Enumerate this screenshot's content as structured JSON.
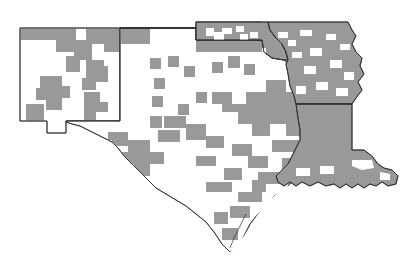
{
  "figure": {
    "name": "south-central-us-county-map",
    "type": "choropleth-county-map",
    "background_color": "#ffffff",
    "shaded_color": "#999999",
    "unshaded_color": "#ffffff",
    "border_color": "#2b2b2b",
    "width": 418,
    "height": 277
  },
  "legend": {
    "shaded_label": "",
    "unshaded_label": "",
    "visible": false
  },
  "states": [
    {
      "code": "NM",
      "name": "New Mexico",
      "shaded_share": "partial"
    },
    {
      "code": "TX",
      "name": "Texas",
      "shaded_share": "partial"
    },
    {
      "code": "OK",
      "name": "Oklahoma",
      "shaded_share": "mostly"
    },
    {
      "code": "AR",
      "name": "Arkansas",
      "shaded_share": "mostly"
    },
    {
      "code": "LA",
      "name": "Louisiana",
      "shaded_share": "mostly"
    }
  ],
  "annotations": [],
  "title": "",
  "subtitle": ""
}
